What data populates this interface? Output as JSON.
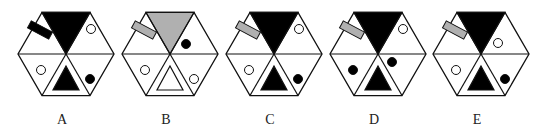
{
  "puzzle": {
    "colors": {
      "black": "#000000",
      "gray": "#b0b0b0",
      "white": "#ffffff",
      "stroke": "#111111"
    },
    "options": [
      {
        "label": "A",
        "cx": 66,
        "top": "black",
        "bar": "black",
        "upper_right_circle": "open",
        "lower_left_circle": "open",
        "bottom_triangle": "black",
        "lower_right_circle": "filled",
        "upper_right_pos": "high"
      },
      {
        "label": "B",
        "cx": 170,
        "top": "gray",
        "bar": "gray",
        "upper_right_circle": "filled",
        "lower_left_circle": "open",
        "bottom_triangle": "open",
        "lower_right_circle": "open",
        "upper_right_pos": "mid"
      },
      {
        "label": "C",
        "cx": 274,
        "top": "black",
        "bar": "gray",
        "upper_right_circle": "open",
        "lower_left_circle": "open",
        "bottom_triangle": "black",
        "lower_right_circle": "filled",
        "upper_right_pos": "high"
      },
      {
        "label": "D",
        "cx": 378,
        "top": "black",
        "bar": "gray",
        "upper_right_circle": "open",
        "lower_left_circle": "filled",
        "bottom_triangle": "black",
        "lower_right_circle": "filled",
        "upper_right_pos": "high",
        "lower_right_pos": "high"
      },
      {
        "label": "E",
        "cx": 481,
        "top": "black",
        "bar": "gray",
        "upper_right_circle": "open",
        "lower_left_circle": "open",
        "bottom_triangle": "black",
        "lower_right_circle": "filled",
        "upper_right_pos": "low"
      }
    ]
  }
}
